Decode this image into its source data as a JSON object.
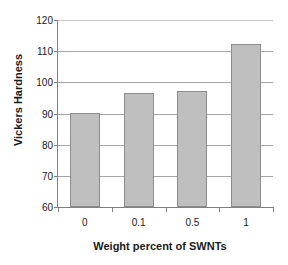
{
  "chart_data": {
    "type": "bar",
    "title": "",
    "categories": [
      "0",
      "0.1",
      "0.5",
      "1"
    ],
    "values": [
      90.2,
      96.7,
      97.1,
      112.3
    ],
    "series": [
      {
        "name": "Vickers Hardness",
        "values": [
          90.2,
          96.7,
          97.1,
          112.3
        ]
      }
    ],
    "xlabel": "Weight percent of SWNTs",
    "ylabel": "Vickers Hardness",
    "ylim": [
      60,
      120
    ],
    "yticks": [
      60,
      70,
      80,
      90,
      100,
      110,
      120
    ],
    "ytick_labels": [
      "60",
      "70",
      "80",
      "90",
      "100",
      "110",
      "120"
    ],
    "grid": "horizontal",
    "legend": "none",
    "bar_color": "#bfbfbf",
    "bar_border_color": "#8c8c8c",
    "axis_color": "#808080",
    "gridline_color": "#a6a6a6",
    "text_color": "#1a1a1a"
  }
}
